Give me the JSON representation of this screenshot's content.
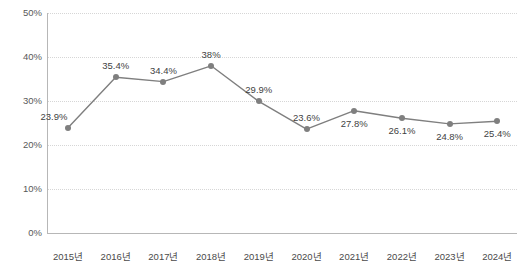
{
  "chart_data": {
    "type": "line",
    "title": "",
    "xlabel": "",
    "ylabel": "",
    "categories": [
      "2015년",
      "2016년",
      "2017년",
      "2018년",
      "2019년",
      "2020년",
      "2021년",
      "2022년",
      "2023년",
      "2024년"
    ],
    "values": [
      23.9,
      35.4,
      34.4,
      38,
      29.9,
      23.6,
      27.8,
      26.1,
      24.8,
      25.4
    ],
    "data_labels": [
      "23.9%",
      "35.4%",
      "34.4%",
      "38%",
      "29.9%",
      "23.6%",
      "27.8%",
      "26.1%",
      "24.8%",
      "25.4%"
    ],
    "label_positions": [
      "below-left",
      "above",
      "above",
      "above",
      "above",
      "above",
      "below",
      "below",
      "below",
      "below"
    ],
    "ylim": [
      0,
      50
    ],
    "yticks": [
      0,
      10,
      20,
      30,
      40,
      50
    ],
    "ytick_labels": [
      "0%",
      "10%",
      "20%",
      "30%",
      "40%",
      "50%"
    ],
    "grid": true,
    "grid_style": "dotted-horizontal",
    "legend": "none",
    "series_color": "#7f7f7f",
    "marker": "circle",
    "marker_color": "#7f7f7f"
  },
  "axes": {
    "axis_color": "#b7b7b7",
    "gridline_color": "#d6d6d6",
    "tick_text_color": "#595959"
  },
  "clipped_header": {
    "text": ""
  }
}
